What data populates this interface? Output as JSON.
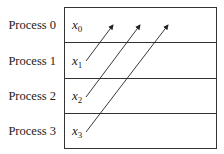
{
  "diagram": {
    "rows": [
      {
        "process": "Process 0",
        "var": "x",
        "sub": "0"
      },
      {
        "process": "Process 1",
        "var": "x",
        "sub": "1"
      },
      {
        "process": "Process 2",
        "var": "x",
        "sub": "2"
      },
      {
        "process": "Process 3",
        "var": "x",
        "sub": "3"
      }
    ],
    "arrows": [
      {
        "from": "x1",
        "to": "Process 0"
      },
      {
        "from": "x2",
        "to": "Process 0"
      },
      {
        "from": "x3",
        "to": "Process 0"
      }
    ]
  }
}
